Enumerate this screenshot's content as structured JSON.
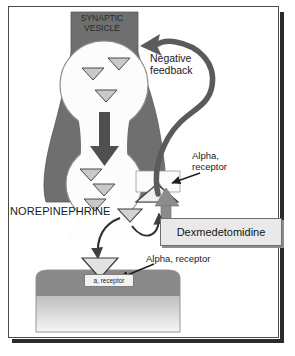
{
  "figure": {
    "border_color": "#4a4a4a",
    "background": "#ffffff"
  },
  "labels": {
    "synaptic_vesicle": "SYNAPTIC\nVESICLE",
    "negative_feedback": "Negative\nfeedback",
    "alpha_receptor_presynaptic": "Alpha,\nreceptor",
    "norepinephrine": "NOREPINEPHRINE",
    "alpha_receptor_postsynaptic": "Alpha, receptor",
    "postsynaptic_receptor_tag": "a, receptor",
    "dexmedetomidine": "Dexmedetomidine"
  },
  "colors": {
    "neuron_fill": "#6f6f6f",
    "neuron_fill_light": "#a9a9a9",
    "vesicle_fill": "#fbfbfb",
    "arrow_dark": "#4f4f4f",
    "arrow_black": "#2a2a2a",
    "cell_top_band": "#8a8a8a",
    "cell_gradient_top": "#9c9c9c",
    "cell_gradient_bottom": "#f4f4f4",
    "box_fill": "#e9e9e9",
    "text": "#1a1a1a"
  },
  "elements": {
    "vesicle_upper_neurotransmitters": 3,
    "vesicle_lower_neurotransmitters": 3,
    "cleft_neurotransmitters": 1,
    "presynaptic_bound_ligand": 1,
    "postsynaptic_bound_ligand": 1
  }
}
